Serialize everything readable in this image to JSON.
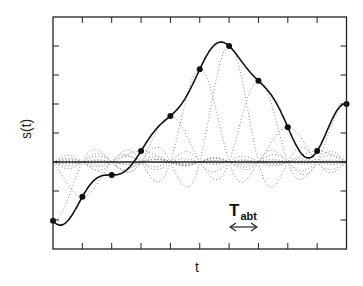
{
  "chart_data": {
    "type": "line",
    "title": "",
    "xlabel": "t",
    "ylabel": "s(t)",
    "annotation": {
      "text_main": "T",
      "text_sub": "abt",
      "arrow": "double-headed, spans one sample period"
    },
    "grid": false,
    "legend": null,
    "xlim": [
      0,
      10
    ],
    "ylim": [
      -3,
      5.5
    ],
    "x_ticks_count": 9,
    "y_ticks_count": 7,
    "zero_line": 0,
    "samples": {
      "x": [
        0,
        1,
        2,
        3,
        4,
        5,
        6,
        7,
        8,
        9,
        10
      ],
      "y": [
        -2.03,
        -1.2,
        -0.45,
        0.38,
        1.59,
        3.2,
        4.0,
        2.8,
        1.2,
        0.38,
        2.0
      ]
    },
    "series": [
      {
        "name": "reconstructed signal s(t)",
        "style": "solid",
        "marker": "filled-circle at samples"
      },
      {
        "name": "weighted sinc components",
        "style": "dotted"
      }
    ]
  },
  "labels": {
    "ylabel": "s(t)",
    "xlabel": "t",
    "tabt_main": "T",
    "tabt_sub": "abt"
  },
  "colors": {
    "solid": "#111111",
    "dotted": "#8a8a8a",
    "axes": "#222222"
  }
}
